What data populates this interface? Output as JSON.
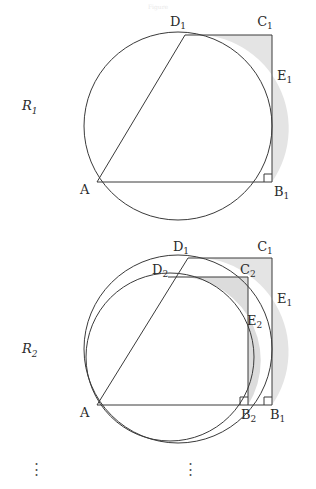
{
  "figure": {
    "kind": "geometry-diagram",
    "background": "#ffffff",
    "stroke_color": "#3a3a3a",
    "shade_color": "#e2e2e2",
    "shade_stroke": "#bdbdbd",
    "header_faint_text": "Figure"
  },
  "panel1": {
    "region_label": "R",
    "region_sub": "1",
    "points": [
      {
        "name": "D",
        "sub": "1",
        "label_x": 178,
        "label_y": 26,
        "px": 185,
        "py": 35
      },
      {
        "name": "C",
        "sub": "1",
        "label_x": 265,
        "label_y": 26,
        "px": 272,
        "py": 35
      },
      {
        "name": "E",
        "sub": "1",
        "label_x": 276,
        "label_y": 78,
        "px": 272,
        "py": 84
      },
      {
        "name": "A",
        "sub": "",
        "label_x": 82,
        "label_y": 192,
        "px": 97,
        "py": 182
      },
      {
        "name": "B",
        "sub": "1",
        "label_x": 274,
        "label_y": 194,
        "px": 272,
        "py": 182
      }
    ],
    "circle": {
      "cx": 178,
      "cy": 126,
      "r": 94
    },
    "right_angle_at": "B1"
  },
  "panel2": {
    "region_label": "R",
    "region_sub": "2",
    "points": [
      {
        "name": "D",
        "sub": "1",
        "label_x": 181,
        "label_y": 249,
        "px": 188,
        "py": 258
      },
      {
        "name": "C",
        "sub": "1",
        "label_x": 265,
        "label_y": 249,
        "px": 272,
        "py": 258
      },
      {
        "name": "D",
        "sub": "2",
        "label_x": 152,
        "label_y": 271,
        "px": 168,
        "py": 277
      },
      {
        "name": "C",
        "sub": "2",
        "label_x": 240,
        "label_y": 271,
        "px": 248,
        "py": 277
      },
      {
        "name": "E",
        "sub": "1",
        "label_x": 276,
        "label_y": 300,
        "px": 272,
        "py": 306
      },
      {
        "name": "E",
        "sub": "2",
        "label_x": 248,
        "label_y": 322,
        "px": 248,
        "py": 328
      },
      {
        "name": "A",
        "sub": "",
        "label_x": 82,
        "label_y": 415,
        "px": 97,
        "py": 405
      },
      {
        "name": "B",
        "sub": "2",
        "label_x": 243,
        "label_y": 417,
        "px": 248,
        "py": 405
      },
      {
        "name": "B",
        "sub": "1",
        "label_x": 272,
        "label_y": 417,
        "px": 272,
        "py": 405
      }
    ],
    "circle_outer": {
      "cx": 178,
      "cy": 349,
      "r": 94
    },
    "circle_inner": {
      "cx": 170,
      "cy": 357,
      "r": 84
    },
    "right_angle_at": [
      "B2",
      "B1"
    ]
  },
  "ellipsis": {
    "glyph": "⋮",
    "left_x": 36,
    "right_x": 190,
    "y": 470
  }
}
